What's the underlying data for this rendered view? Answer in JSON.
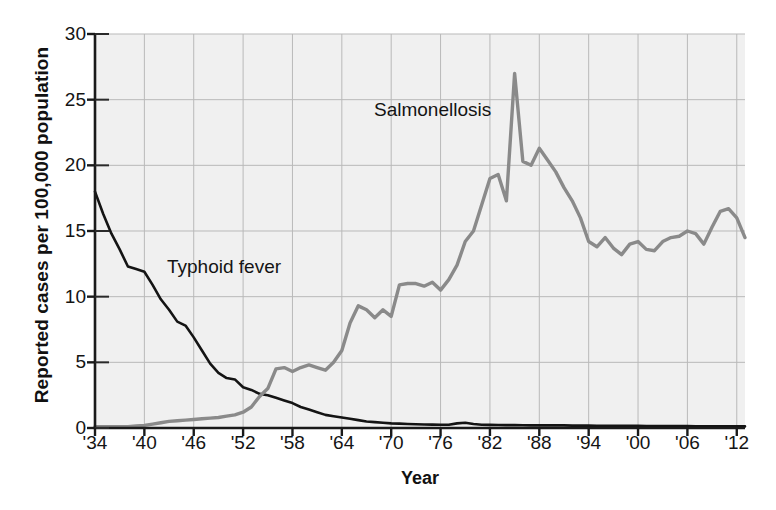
{
  "chart_data": {
    "type": "line",
    "title": "",
    "xlabel": "Year",
    "ylabel": "Reported cases per 100,000 population",
    "xlim": [
      1934,
      2013
    ],
    "ylim": [
      0,
      30
    ],
    "ytick_labels": [
      "0",
      "5",
      "10",
      "15",
      "20",
      "25",
      "30"
    ],
    "ytick_values": [
      0,
      5,
      10,
      15,
      20,
      25,
      30
    ],
    "xtick_labels": [
      "'34",
      "'40",
      "'46",
      "'52",
      "'58",
      "'64",
      "'70",
      "'76",
      "'82",
      "'88",
      "'94",
      "'00",
      "'06",
      "'12"
    ],
    "xtick_values": [
      1934,
      1940,
      1946,
      1952,
      1958,
      1964,
      1970,
      1976,
      1982,
      1988,
      1994,
      2000,
      2006,
      2012
    ],
    "grid": true,
    "legend_position": "inline-annotations",
    "plot_bg": "#f0f0f0",
    "grid_color": "#b9b9b9",
    "axis_color": "#1a1a1a",
    "series": [
      {
        "name": "Typhoid fever",
        "color": "#141414",
        "annotation": "Typhoid fever",
        "x": [
          1934,
          1935,
          1936,
          1937,
          1938,
          1939,
          1940,
          1941,
          1942,
          1943,
          1944,
          1945,
          1946,
          1947,
          1948,
          1949,
          1950,
          1951,
          1952,
          1953,
          1954,
          1955,
          1956,
          1957,
          1958,
          1959,
          1960,
          1961,
          1962,
          1963,
          1964,
          1965,
          1966,
          1967,
          1968,
          1969,
          1970,
          1971,
          1972,
          1973,
          1974,
          1975,
          1976,
          1977,
          1978,
          1979,
          1980,
          1981,
          1982,
          1983,
          1984,
          1985,
          1986,
          1987,
          1988,
          1989,
          1990,
          1991,
          1992,
          1993,
          1994,
          1995,
          1996,
          1997,
          1998,
          1999,
          2000,
          2001,
          2002,
          2003,
          2004,
          2005,
          2006,
          2007,
          2008,
          2009,
          2010,
          2011,
          2012,
          2013
        ],
        "values": [
          18.0,
          16.3,
          14.8,
          13.6,
          12.3,
          12.1,
          11.9,
          10.9,
          9.8,
          9.0,
          8.1,
          7.8,
          6.9,
          5.9,
          4.9,
          4.2,
          3.8,
          3.7,
          3.1,
          2.9,
          2.6,
          2.5,
          2.3,
          2.1,
          1.9,
          1.6,
          1.4,
          1.2,
          1.0,
          0.9,
          0.8,
          0.7,
          0.6,
          0.5,
          0.45,
          0.4,
          0.35,
          0.33,
          0.3,
          0.28,
          0.27,
          0.26,
          0.25,
          0.25,
          0.35,
          0.4,
          0.3,
          0.25,
          0.24,
          0.23,
          0.22,
          0.22,
          0.21,
          0.2,
          0.2,
          0.2,
          0.2,
          0.2,
          0.18,
          0.18,
          0.18,
          0.17,
          0.17,
          0.17,
          0.16,
          0.16,
          0.16,
          0.15,
          0.15,
          0.15,
          0.14,
          0.14,
          0.14,
          0.13,
          0.13,
          0.13,
          0.13,
          0.12,
          0.12,
          0.12
        ]
      },
      {
        "name": "Salmonellosis",
        "color": "#8a8a8a",
        "annotation": "Salmonellosis",
        "x": [
          1934,
          1935,
          1936,
          1937,
          1938,
          1939,
          1940,
          1941,
          1942,
          1943,
          1944,
          1945,
          1946,
          1947,
          1948,
          1949,
          1950,
          1951,
          1952,
          1953,
          1954,
          1955,
          1956,
          1957,
          1958,
          1959,
          1960,
          1961,
          1962,
          1963,
          1964,
          1965,
          1966,
          1967,
          1968,
          1969,
          1970,
          1971,
          1972,
          1973,
          1974,
          1975,
          1976,
          1977,
          1978,
          1979,
          1980,
          1981,
          1982,
          1983,
          1984,
          1985,
          1986,
          1987,
          1988,
          1989,
          1990,
          1991,
          1992,
          1993,
          1994,
          1995,
          1996,
          1997,
          1998,
          1999,
          2000,
          2001,
          2002,
          2003,
          2004,
          2005,
          2006,
          2007,
          2008,
          2009,
          2010,
          2011,
          2012,
          2013
        ],
        "values": [
          0.1,
          0.1,
          0.1,
          0.1,
          0.1,
          0.15,
          0.2,
          0.3,
          0.4,
          0.5,
          0.55,
          0.6,
          0.65,
          0.7,
          0.75,
          0.8,
          0.9,
          1.0,
          1.2,
          1.6,
          2.4,
          3.0,
          4.5,
          4.6,
          4.3,
          4.6,
          4.8,
          4.6,
          4.4,
          5.0,
          5.9,
          8.0,
          9.3,
          9.0,
          8.4,
          9.0,
          8.5,
          10.9,
          11.0,
          11.0,
          10.8,
          11.1,
          10.5,
          11.3,
          12.4,
          14.2,
          15.0,
          17.0,
          19.0,
          19.3,
          17.3,
          27.0,
          20.3,
          20.0,
          21.3,
          20.4,
          19.5,
          18.3,
          17.3,
          16.0,
          14.2,
          13.8,
          14.5,
          13.7,
          13.2,
          14.0,
          14.2,
          13.6,
          13.5,
          14.2,
          14.5,
          14.6,
          15.0,
          14.8,
          14.0,
          15.3,
          16.5,
          16.7,
          16.0,
          14.5
        ]
      }
    ]
  },
  "figure": {
    "ylabel": "Reported cases per 100,000 population",
    "xlabel": "Year"
  }
}
